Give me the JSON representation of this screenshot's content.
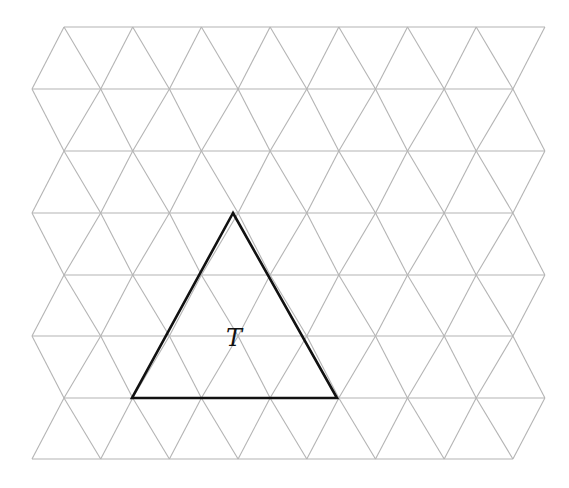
{
  "diagram": {
    "type": "triangular-lattice",
    "colors": {
      "grid": "#b4b4b4",
      "triangle": "#111111",
      "background": "#ffffff"
    },
    "grid": {
      "rows_y": [
        27,
        89,
        151,
        213,
        275,
        336,
        398,
        459
      ],
      "spacing": 68.7,
      "even_row_start_x": 64,
      "odd_row_start_x": 32,
      "points_per_row": 8
    },
    "highlighted_triangle": {
      "label": "T",
      "vertices": [
        [
          233,
          213
        ],
        [
          132,
          398
        ],
        [
          337,
          398
        ]
      ],
      "label_position": [
        234,
        346
      ]
    }
  }
}
